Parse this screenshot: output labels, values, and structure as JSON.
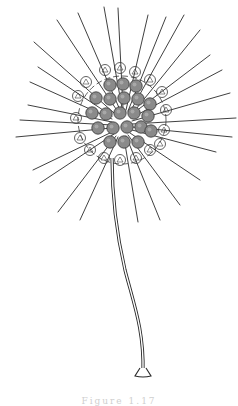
{
  "figure": {
    "background_color": "#ffffff",
    "ink_color": "#2a2a2a",
    "cell_fill_color": "#8a8a8a",
    "body": {
      "cx": 122,
      "cy": 120,
      "r": 44
    },
    "spines": [
      [
        57,
        20,
        118,
        112
      ],
      [
        78,
        13,
        120,
        110
      ],
      [
        104,
        7,
        122,
        108
      ],
      [
        118,
        8,
        123,
        108
      ],
      [
        148,
        15,
        126,
        110
      ],
      [
        166,
        17,
        128,
        111
      ],
      [
        184,
        15,
        130,
        112
      ],
      [
        200,
        30,
        132,
        114
      ],
      [
        34,
        42,
        114,
        113
      ],
      [
        38,
        67,
        112,
        116
      ],
      [
        30,
        82,
        112,
        119
      ],
      [
        28,
        105,
        112,
        122
      ],
      [
        20,
        120,
        112,
        125
      ],
      [
        16,
        137,
        112,
        128
      ],
      [
        33,
        170,
        112,
        132
      ],
      [
        40,
        183,
        114,
        134
      ],
      [
        58,
        212,
        116,
        136
      ],
      [
        80,
        220,
        118,
        137
      ],
      [
        138,
        222,
        124,
        138
      ],
      [
        160,
        220,
        126,
        136
      ],
      [
        180,
        205,
        128,
        135
      ],
      [
        200,
        180,
        130,
        133
      ],
      [
        216,
        152,
        132,
        130
      ],
      [
        232,
        137,
        132,
        127
      ],
      [
        236,
        118,
        132,
        124
      ],
      [
        230,
        93,
        132,
        121
      ],
      [
        222,
        70,
        131,
        118
      ],
      [
        210,
        55,
        131,
        115
      ]
    ],
    "cells": [
      [
        110,
        85
      ],
      [
        123,
        84
      ],
      [
        136,
        86
      ],
      [
        96,
        98
      ],
      [
        110,
        99
      ],
      [
        124,
        98
      ],
      [
        138,
        99
      ],
      [
        150,
        104
      ],
      [
        92,
        113
      ],
      [
        106,
        114
      ],
      [
        120,
        113
      ],
      [
        134,
        113
      ],
      [
        148,
        116
      ],
      [
        98,
        128
      ],
      [
        113,
        128
      ],
      [
        127,
        127
      ],
      [
        141,
        127
      ],
      [
        151,
        131
      ],
      [
        110,
        142
      ],
      [
        124,
        142
      ],
      [
        138,
        142
      ]
    ],
    "frame_cells": [
      [
        105,
        70
      ],
      [
        120,
        68
      ],
      [
        135,
        72
      ],
      [
        86,
        82
      ],
      [
        150,
        80
      ],
      [
        78,
        96
      ],
      [
        162,
        92
      ],
      [
        76,
        118
      ],
      [
        166,
        110
      ],
      [
        80,
        138
      ],
      [
        164,
        130
      ],
      [
        90,
        150
      ],
      [
        150,
        150
      ],
      [
        104,
        158
      ],
      [
        120,
        160
      ],
      [
        136,
        158
      ],
      [
        160,
        144
      ]
    ],
    "stalk_path": "M112,158 C112,200 118,240 125,270 C134,305 144,330 143,372",
    "foot": {
      "x": 143,
      "y": 372,
      "w": 16,
      "h": 8
    }
  },
  "caption": {
    "text": "Figure 1.17"
  }
}
